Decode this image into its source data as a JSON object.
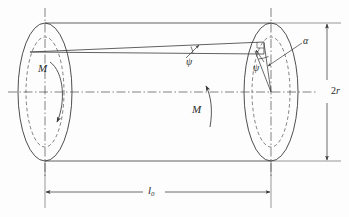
{
  "figure": {
    "background_color": "#fdfdfd",
    "line_color": "#3a3a3a",
    "dash_color": "#4a4a4a",
    "text_color": "#2b2b2b",
    "width": 349,
    "height": 217
  },
  "labels": {
    "moment_left": "M",
    "moment_right": "M",
    "helix_angle": "ψ",
    "twist_angle": "α",
    "surface_angle": "ψ",
    "diameter_value": "2",
    "diameter_symbol": "r",
    "length_symbol": "l",
    "length_subscript": "0"
  },
  "geometry": {
    "left_face_center_x": 45,
    "left_face_center_y": 92,
    "right_face_center_x": 271,
    "right_face_center_y": 92,
    "outer_rx": 27,
    "outer_ry": 69,
    "inner_rx": 19,
    "inner_ry": 55,
    "shaft_top_y": 23,
    "shaft_bottom_y": 161,
    "dimension_length_y": 192,
    "dimension_diameter_x": 327
  },
  "elements": {
    "left_end_face": "outer-ellipse-solid",
    "left_inner_circle": "inner-ellipse-dashed",
    "right_end_face": "outer-ellipse-solid",
    "right_inner_circle": "inner-ellipse-dashed",
    "centerline": "dash-dot horizontal axis",
    "vertical_axes": "dash-dot vertical axes at both faces",
    "helix_line": "inclined generator line from left apex to right face",
    "generator_line": "straight axial generator line",
    "right_angle_marker": "square corner at right face top",
    "length_dimension": "double-headed horizontal arrow",
    "diameter_dimension": "double-headed vertical arrow"
  }
}
